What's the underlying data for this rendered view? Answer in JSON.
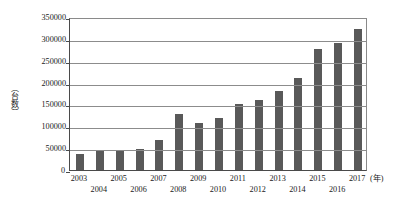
{
  "chart_data": {
    "type": "bar",
    "title": "",
    "xlabel": "(年)",
    "ylabel": "（台数）",
    "categories": [
      "2003",
      "2004",
      "2005",
      "2006",
      "2007",
      "2008",
      "2009",
      "2010",
      "2011",
      "2012",
      "2013",
      "2014",
      "2015",
      "2016",
      "2017"
    ],
    "values": [
      37000,
      44000,
      44000,
      48000,
      69000,
      128000,
      108000,
      119000,
      151000,
      160000,
      181000,
      211000,
      277000,
      291000,
      322000
    ],
    "ylim": [
      0,
      350000
    ],
    "ytick_labels": [
      "0",
      "50000",
      "100000",
      "150000",
      "200000",
      "250000",
      "300000",
      "350000"
    ],
    "ytick_values": [
      0,
      50000,
      100000,
      150000,
      200000,
      250000,
      300000,
      350000
    ],
    "grid": true,
    "legend": "none",
    "bar_color": "#595959",
    "axis_color": "#4a4a4a",
    "grid_color": "#8c8c8c"
  }
}
